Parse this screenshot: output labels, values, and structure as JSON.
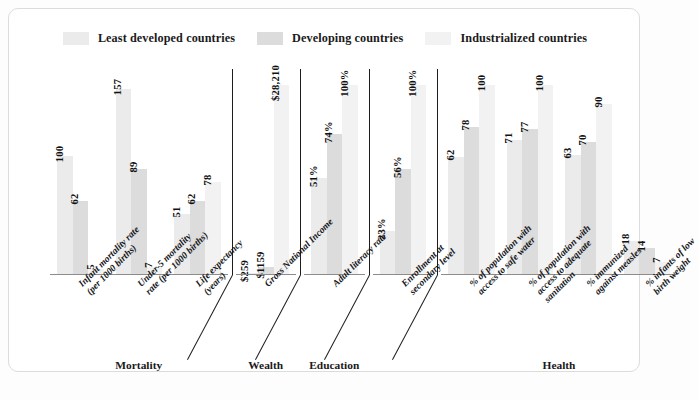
{
  "legend": {
    "items": [
      {
        "label": "Least developed countries",
        "color": "#ebebeb",
        "name": "legend-least-developed"
      },
      {
        "label": "Developing countries",
        "color": "#dcdcdc",
        "name": "legend-developing"
      },
      {
        "label": "Industrialized countries",
        "color": "#f2f2f2",
        "name": "legend-industrialized"
      }
    ]
  },
  "chart_data": {
    "type": "bar",
    "title": "",
    "xlabel": "",
    "ylabel": "",
    "grid": false,
    "legend_position": "top-center",
    "series": [
      {
        "name": "Least developed countries",
        "color": "#ebebeb"
      },
      {
        "name": "Developing countries",
        "color": "#dcdcdc"
      },
      {
        "name": "Industrialized countries",
        "color": "#f2f2f2"
      }
    ],
    "note": "Each category uses an independent vertical scale; bars are labelled with their values.",
    "supergroups": [
      {
        "title": "Mortality",
        "categories": [
          {
            "label": "Infant mortality rate\n(per 1000 births)",
            "label_lines": [
              "Infant mortality rate",
              "(per 1000 births)"
            ],
            "values": [
              100,
              62,
              5
            ],
            "display": [
              "100",
              "62",
              "5"
            ],
            "scale_max": 160
          },
          {
            "label": "Under-5 mortality\nrate (per 1000 births)",
            "label_lines": [
              "Under-5 mortality",
              "rate (per 1000 births)"
            ],
            "values": [
              157,
              89,
              7
            ],
            "display": [
              "157",
              "89",
              "7"
            ],
            "scale_max": 160
          },
          {
            "label": "Life expectancy\n(years)",
            "label_lines": [
              "Life expectancy",
              "(years)"
            ],
            "values": [
              51,
              62,
              78
            ],
            "display": [
              "51",
              "62",
              "78"
            ],
            "scale_max": 160
          }
        ]
      },
      {
        "title": "Wealth",
        "categories": [
          {
            "label": "Gross National Income",
            "label_lines": [
              "Gross National Income"
            ],
            "values": [
              259,
              1159,
              28210
            ],
            "display": [
              "$259",
              "$1159",
              "$28,210"
            ],
            "scale_max": 28210
          }
        ]
      },
      {
        "title": "Education",
        "categories": [
          {
            "label": "Adult literacy rate",
            "label_lines": [
              "Adult literacy rate"
            ],
            "values": [
              51,
              74,
              100
            ],
            "display": [
              "51%",
              "74%",
              "100%"
            ],
            "scale_max": 100
          }
        ]
      },
      {
        "title": "",
        "categories": [
          {
            "label": "Enrollment at\nsecondary level",
            "label_lines": [
              "Enrollment at",
              "secondary level"
            ],
            "values": [
              23,
              56,
              100
            ],
            "display": [
              "23%",
              "56%",
              "100%"
            ],
            "scale_max": 100
          }
        ]
      },
      {
        "title": "Health",
        "categories": [
          {
            "label": "% of population with\naccess to safe water",
            "label_lines": [
              "% of population with",
              "access to safe water"
            ],
            "values": [
              62,
              78,
              100
            ],
            "display": [
              "62",
              "78",
              "100"
            ],
            "scale_max": 100
          },
          {
            "label": "% of population with\naccess to adequate\nsanitation",
            "label_lines": [
              "% of population with",
              "access to adequate",
              "sanitation"
            ],
            "values": [
              71,
              77,
              100
            ],
            "display": [
              "71",
              "77",
              "100"
            ],
            "scale_max": 100
          },
          {
            "label": "% immunized\nagainst measles",
            "label_lines": [
              "% immunized",
              "against measles"
            ],
            "values": [
              63,
              70,
              90
            ],
            "display": [
              "63",
              "70",
              "90"
            ],
            "scale_max": 100
          },
          {
            "label": "% infants of low\nbirth weight",
            "label_lines": [
              "% infants of low",
              "birth weight"
            ],
            "values": [
              18,
              14,
              7
            ],
            "display": [
              "18",
              "14",
              "7"
            ],
            "scale_max": 100
          }
        ]
      }
    ]
  }
}
